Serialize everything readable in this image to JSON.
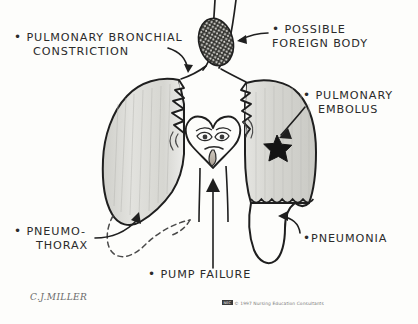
{
  "figure": {
    "signature": "C.J.MILLER",
    "copyright": {
      "mark": "NEC",
      "text": "© 1997 Nursing Education Consultants"
    }
  },
  "colors": {
    "ink": "#2b2b2b",
    "paper": "#fdfdfb",
    "lung_fill": "#dcdcd8",
    "lung_fill_light": "#e8e8e4",
    "outline": "#1f1f1f",
    "dashed": "#4a4a4a",
    "blob_dark": "#2a2a2a"
  },
  "labels": [
    {
      "id": "bronchial",
      "line1": "PULMONARY BRONCHIAL",
      "line2": "CONSTRICTION",
      "bullet": true,
      "points_to": "left-lung-bronchus"
    },
    {
      "id": "foreign",
      "line1": "POSSIBLE",
      "line2": "FOREIGN BODY",
      "bullet": true,
      "points_to": "trachea-blob"
    },
    {
      "id": "embolus",
      "line1": "PULMONARY",
      "line2": "EMBOLUS",
      "bullet": true,
      "points_to": "right-lung-star"
    },
    {
      "id": "pneumothorax",
      "line1": "PNEUMO-",
      "line2": "THORAX",
      "bullet": true,
      "points_to": "left-lung-collapsed-space"
    },
    {
      "id": "pneumonia",
      "line1": "PNEUMONIA",
      "line2": "",
      "bullet": true,
      "points_to": "right-lung-fluid-level"
    },
    {
      "id": "pump_failure",
      "line1": "PUMP FAILURE",
      "line2": "",
      "bullet": true,
      "points_to": "heart"
    }
  ],
  "anatomy": {
    "trachea": "trachea",
    "left_lung": "left-lung",
    "right_lung": "right-lung",
    "heart": "heart-with-sick-face",
    "foreign_body": "speckled-oval-obstruction",
    "embolus": "black-star",
    "fluid_level": "scalloped-wavy-line",
    "collapsed_space": "dashed-outline"
  }
}
